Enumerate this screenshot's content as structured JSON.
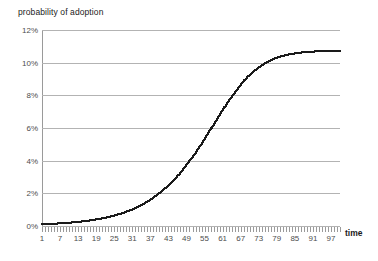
{
  "chart_data": {
    "type": "line",
    "title": "",
    "ylabel": "probability of adoption",
    "xlabel": "time",
    "ylim": [
      0,
      12
    ],
    "xlim": [
      1,
      100
    ],
    "grid": true,
    "legend": false,
    "marker_style": "small-square",
    "series_color": "#1a1a1a",
    "gridline_color": "#b3b3b3",
    "ytick_labels": [
      "0%",
      "2%",
      "4%",
      "6%",
      "8%",
      "10%",
      "12%"
    ],
    "ytick_values": [
      0,
      2,
      4,
      6,
      8,
      10,
      12
    ],
    "xtick_labels": [
      "1",
      "7",
      "13",
      "19",
      "25",
      "31",
      "37",
      "43",
      "49",
      "55",
      "61",
      "67",
      "73",
      "79",
      "85",
      "91",
      "97"
    ],
    "xtick_values": [
      1,
      7,
      13,
      19,
      25,
      31,
      37,
      43,
      49,
      55,
      61,
      67,
      73,
      79,
      85,
      91,
      97
    ],
    "series": [
      {
        "name": "probability of adoption",
        "x": [
          1,
          2,
          3,
          4,
          5,
          6,
          7,
          8,
          9,
          10,
          11,
          12,
          13,
          14,
          15,
          16,
          17,
          18,
          19,
          20,
          21,
          22,
          23,
          24,
          25,
          26,
          27,
          28,
          29,
          30,
          31,
          32,
          33,
          34,
          35,
          36,
          37,
          38,
          39,
          40,
          41,
          42,
          43,
          44,
          45,
          46,
          47,
          48,
          49,
          50,
          51,
          52,
          53,
          54,
          55,
          56,
          57,
          58,
          59,
          60,
          61,
          62,
          63,
          64,
          65,
          66,
          67,
          68,
          69,
          70,
          71,
          72,
          73,
          74,
          75,
          76,
          77,
          78,
          79,
          80,
          81,
          82,
          83,
          84,
          85,
          86,
          87,
          88,
          89,
          90,
          91,
          92,
          93,
          94,
          95,
          96,
          97,
          98,
          99,
          100
        ],
        "values": [
          0.11,
          0.12,
          0.12,
          0.13,
          0.14,
          0.15,
          0.16,
          0.17,
          0.19,
          0.2,
          0.22,
          0.23,
          0.25,
          0.27,
          0.29,
          0.32,
          0.34,
          0.37,
          0.4,
          0.43,
          0.47,
          0.5,
          0.55,
          0.59,
          0.64,
          0.69,
          0.74,
          0.8,
          0.87,
          0.94,
          1.01,
          1.09,
          1.18,
          1.27,
          1.37,
          1.48,
          1.59,
          1.72,
          1.85,
          1.99,
          2.14,
          2.3,
          2.47,
          2.65,
          2.84,
          3.04,
          3.26,
          3.48,
          3.72,
          3.96,
          4.22,
          4.48,
          4.76,
          5.04,
          5.33,
          5.62,
          5.91,
          6.21,
          6.51,
          6.8,
          7.09,
          7.37,
          7.65,
          7.91,
          8.17,
          8.41,
          8.64,
          8.86,
          9.06,
          9.25,
          9.42,
          9.58,
          9.72,
          9.85,
          9.96,
          10.07,
          10.16,
          10.24,
          10.31,
          10.37,
          10.42,
          10.47,
          10.51,
          10.54,
          10.57,
          10.6,
          10.62,
          10.64,
          10.66,
          10.67,
          10.68,
          10.69,
          10.7,
          10.71,
          10.71,
          10.72,
          10.72,
          10.73,
          10.73,
          10.73
        ]
      }
    ]
  }
}
